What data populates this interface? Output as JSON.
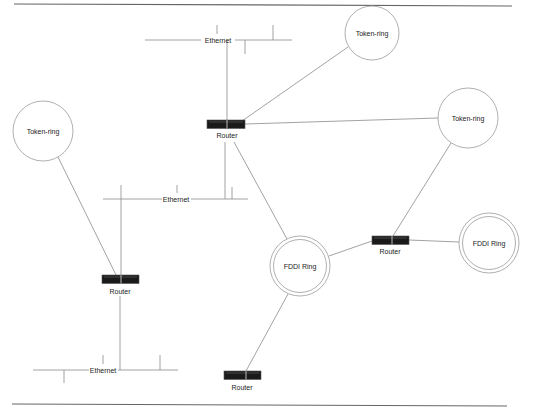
{
  "diagram": {
    "type": "network-topology",
    "nodes": {
      "token_ring_top": {
        "label": "Token-ring",
        "kind": "token-ring",
        "cx": 372,
        "cy": 33,
        "r": 27
      },
      "token_ring_right": {
        "label": "Token-ring",
        "kind": "token-ring",
        "cx": 468,
        "cy": 118,
        "r": 30
      },
      "token_ring_left": {
        "label": "Token-ring",
        "kind": "token-ring",
        "cx": 43,
        "cy": 131,
        "r": 30
      },
      "fddi_center": {
        "label": "FDDI Ring",
        "kind": "fddi-ring",
        "cx": 300,
        "cy": 266,
        "r": 30
      },
      "fddi_right": {
        "label": "FDDI Ring",
        "kind": "fddi-ring",
        "cx": 489,
        "cy": 243,
        "r": 30
      },
      "router_top": {
        "label": "Router",
        "kind": "router",
        "x": 207,
        "y": 120
      },
      "router_left": {
        "label": "Router",
        "kind": "router",
        "x": 102,
        "y": 275
      },
      "router_right": {
        "label": "Router",
        "kind": "router",
        "x": 372,
        "y": 236
      },
      "router_bottom": {
        "label": "Router",
        "kind": "router",
        "x": 224,
        "y": 371
      },
      "ethernet_top": {
        "label": "Ethernet",
        "kind": "ethernet"
      },
      "ethernet_middle": {
        "label": "Ethernet",
        "kind": "ethernet"
      },
      "ethernet_bottom": {
        "label": "Ethernet",
        "kind": "ethernet"
      }
    },
    "edges": [
      [
        "router_top",
        "ethernet_top"
      ],
      [
        "router_top",
        "token_ring_top"
      ],
      [
        "router_top",
        "token_ring_right"
      ],
      [
        "router_top",
        "ethernet_middle"
      ],
      [
        "router_top",
        "fddi_center"
      ],
      [
        "router_left",
        "token_ring_left"
      ],
      [
        "router_left",
        "ethernet_middle"
      ],
      [
        "router_left",
        "ethernet_bottom"
      ],
      [
        "router_right",
        "token_ring_right"
      ],
      [
        "router_right",
        "fddi_center"
      ],
      [
        "router_right",
        "fddi_right"
      ],
      [
        "router_bottom",
        "fddi_center"
      ]
    ],
    "colors": {
      "line": "#8a8a8a",
      "router_body": "#1a1a1a",
      "rule": "#666666"
    }
  }
}
